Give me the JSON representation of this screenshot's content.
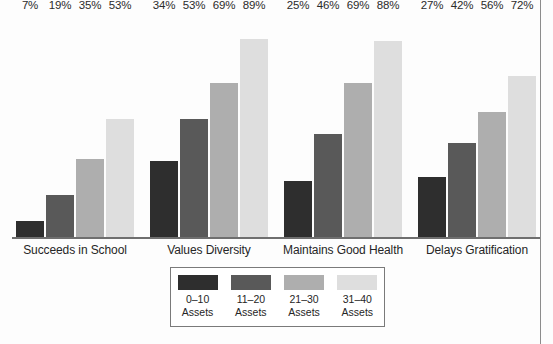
{
  "chart_data": {
    "type": "bar",
    "title": "",
    "xlabel": "",
    "ylabel": "",
    "ylim": [
      0,
      100
    ],
    "grid": false,
    "legend_position": "bottom-center",
    "categories": [
      "Succeeds in School",
      "Values Diversity",
      "Maintains Good Health",
      "Delays Gratification"
    ],
    "series": [
      {
        "name": "0–10 Assets",
        "range": "0–10",
        "unit": "Assets",
        "color": "#2e2e2e",
        "values": [
          7,
          34,
          25,
          27
        ]
      },
      {
        "name": "11–20 Assets",
        "range": "11–20",
        "unit": "Assets",
        "color": "#595959",
        "values": [
          19,
          53,
          46,
          42
        ]
      },
      {
        "name": "21–30 Assets",
        "range": "21–30",
        "unit": "Assets",
        "color": "#aeaeae",
        "values": [
          35,
          69,
          69,
          56
        ]
      },
      {
        "name": "31–40 Assets",
        "range": "31–40",
        "unit": "Assets",
        "color": "#dedede",
        "values": [
          53,
          89,
          88,
          72
        ]
      }
    ],
    "value_suffix": "%",
    "value_labels": [
      [
        "7%",
        "19%",
        "35%",
        "53%"
      ],
      [
        "34%",
        "53%",
        "69%",
        "89%"
      ],
      [
        "25%",
        "46%",
        "69%",
        "88%"
      ],
      [
        "27%",
        "42%",
        "56%",
        "72%"
      ]
    ]
  }
}
